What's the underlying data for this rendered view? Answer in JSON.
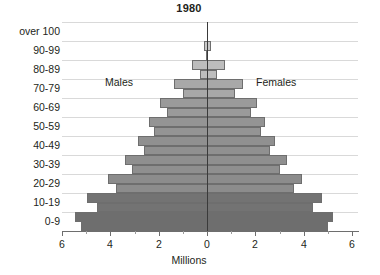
{
  "chart_data": {
    "type": "bar",
    "title": "1980",
    "xlabel": "Millions",
    "ylabel": "",
    "xlim": [
      -6,
      6
    ],
    "xticks": [
      6,
      4,
      2,
      0,
      2,
      4,
      6
    ],
    "xtick_labels": [
      "6",
      "4",
      "2",
      "0",
      "2",
      "4",
      "6"
    ],
    "grid": true,
    "legend_position": "in-plot",
    "orientation": "horizontal-diverging",
    "categories": [
      "0-9",
      "10-19",
      "20-29",
      "30-39",
      "40-49",
      "50-59",
      "60-69",
      "70-79",
      "80-89",
      "90-99",
      "over 100"
    ],
    "annotations": [
      "Males",
      "Females"
    ],
    "series": [
      {
        "name": "Males",
        "side": "left",
        "values": [
          5.45,
          4.95,
          4.1,
          3.4,
          2.85,
          2.4,
          1.95,
          1.35,
          0.62,
          0.12,
          0.01
        ]
      },
      {
        "name": "Females",
        "side": "right",
        "values": [
          5.2,
          4.75,
          3.95,
          3.3,
          2.8,
          2.4,
          2.05,
          1.5,
          0.75,
          0.16,
          0.012
        ]
      }
    ],
    "sub_cohorts": {
      "note": "Each decade band is drawn as two 5-year sub-bars (younger half outer, older half inner)",
      "males": [
        [
          5.45,
          5.2
        ],
        [
          4.95,
          4.55
        ],
        [
          4.1,
          3.75
        ],
        [
          3.4,
          3.1
        ],
        [
          2.85,
          2.6
        ],
        [
          2.4,
          2.2
        ],
        [
          1.95,
          1.65
        ],
        [
          1.35,
          1.0
        ],
        [
          0.62,
          0.3
        ],
        [
          0.12,
          0.04
        ],
        [
          0.012,
          0.008
        ]
      ],
      "females": [
        [
          5.2,
          5.0
        ],
        [
          4.75,
          4.4
        ],
        [
          3.95,
          3.6
        ],
        [
          3.3,
          3.0
        ],
        [
          2.8,
          2.6
        ],
        [
          2.4,
          2.25
        ],
        [
          2.05,
          1.8
        ],
        [
          1.5,
          1.15
        ],
        [
          0.75,
          0.4
        ],
        [
          0.16,
          0.06
        ],
        [
          0.014,
          0.009
        ]
      ]
    },
    "colors": {
      "band_shades": [
        "#6e6e6e",
        "#737373",
        "#8c8c8c",
        "#8f8f8f",
        "#909090",
        "#949494",
        "#9a9a9a",
        "#a8a8a8",
        "#bdbdbd",
        "#c9c9c9",
        "#d0d0d0"
      ],
      "axis": "#3a3a3a",
      "grid": "#d9d9d9",
      "text": "#231f20",
      "background": "#ffffff"
    }
  }
}
